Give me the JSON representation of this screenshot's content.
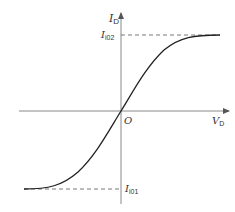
{
  "diagram": {
    "type": "transfer-characteristic",
    "colors": {
      "axis": "#777777",
      "curve": "#222222",
      "dashed": "#555555",
      "text": "#333333"
    },
    "axes": {
      "y_label": {
        "main": "I",
        "sub": "D"
      },
      "x_label": {
        "main": "V",
        "sub": "D"
      },
      "origin_label": "O"
    },
    "levels": {
      "upper": {
        "main": "I",
        "sub": "i02"
      },
      "lower": {
        "main": "I",
        "sub": "i01"
      }
    },
    "curve": {
      "shape": "sigmoid",
      "description": "S-shaped curve through origin saturating at I_i02 (upper) and I_i01 (lower)"
    }
  }
}
